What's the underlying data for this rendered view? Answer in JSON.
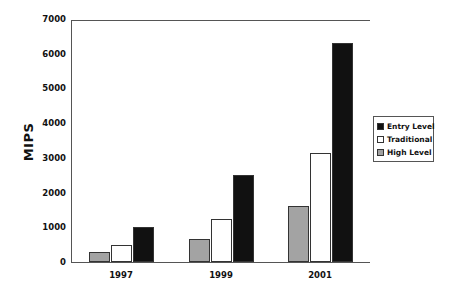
{
  "chart_data": {
    "type": "bar",
    "title": "",
    "xlabel": "",
    "ylabel": "MIPS",
    "ylim": [
      0,
      7000
    ],
    "yticks": [
      0,
      1000,
      2000,
      3000,
      4000,
      5000,
      6000,
      7000
    ],
    "categories": [
      "1997",
      "1999",
      "2001"
    ],
    "grid": false,
    "legend_position": "right",
    "series": [
      {
        "name": "High Level",
        "color": "#a0a0a0",
        "values": [
          300,
          650,
          1600
        ]
      },
      {
        "name": "Traditional",
        "color": "#ffffff",
        "values": [
          500,
          1250,
          3150
        ]
      },
      {
        "name": "Entry Level",
        "color": "#111111",
        "values": [
          1000,
          2500,
          6300
        ]
      }
    ],
    "legend_order": [
      "Entry Level",
      "Traditional",
      "High Level"
    ]
  },
  "labels": {
    "ylabel": "MIPS",
    "yticks": [
      "0",
      "1000",
      "2000",
      "3000",
      "4000",
      "5000",
      "6000",
      "7000"
    ],
    "xticks": [
      "1997",
      "1999",
      "2001"
    ],
    "legend": [
      "Entry Level",
      "Traditional",
      "High Level"
    ]
  }
}
